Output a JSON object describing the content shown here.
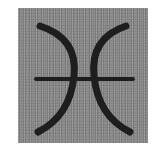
{
  "symbol": {
    "name": "pisces",
    "unicode": "♓",
    "stroke_color": "#1a1a1a",
    "background_color": "#8c8c8c"
  }
}
